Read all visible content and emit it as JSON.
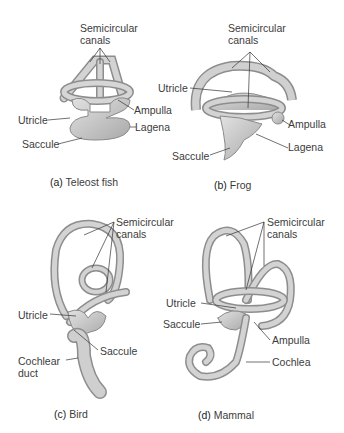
{
  "panels": [
    {
      "id": "a",
      "caption_letter": "(a)",
      "caption_text": "Teleost fish",
      "labels": {
        "semicircular_canals": [
          "Semicircular",
          "canals"
        ],
        "utricle": "Utricle",
        "ampulla": "Ampulla",
        "lagena": "Lagena",
        "saccule": "Saccule"
      }
    },
    {
      "id": "b",
      "caption_letter": "(b)",
      "caption_text": "Frog",
      "labels": {
        "semicircular_canals": [
          "Semicircular",
          "canals"
        ],
        "utricle": "Utricle",
        "ampulla": "Ampulla",
        "lagena": "Lagena",
        "saccule": "Saccule"
      }
    },
    {
      "id": "c",
      "caption_letter": "(c)",
      "caption_text": "Bird",
      "labels": {
        "semicircular_canals": [
          "Semicircular",
          "canals"
        ],
        "utricle": "Utricle",
        "saccule": "Saccule",
        "cochlear_duct": [
          "Cochlear",
          "duct"
        ]
      }
    },
    {
      "id": "d",
      "caption_letter": "(d)",
      "caption_text": "Mammal",
      "labels": {
        "semicircular_canals": [
          "Semicircular",
          "canals"
        ],
        "utricle": "Utricle",
        "saccule": "Saccule",
        "ampulla": "Ampulla",
        "cochlea": "Cochlea"
      }
    }
  ],
  "colors": {
    "structure_fill": "#c9c9c9",
    "structure_stroke": "#8a8a8a",
    "leader_line": "#333333",
    "text": "#3c3c3c"
  }
}
